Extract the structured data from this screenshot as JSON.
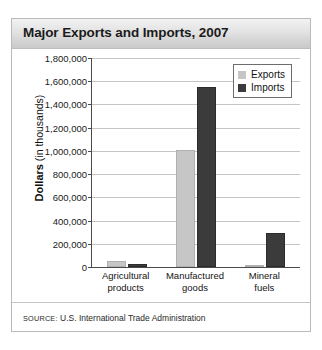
{
  "figure": {
    "title": "Major Exports and Imports, 2007",
    "source_label": "SOURCE:",
    "source_text": " U.S. International Trade Administration",
    "colors": {
      "exports": "#c6c6c6",
      "imports": "#3b3b3b",
      "title_band": "#e2e2e2",
      "gridline": "#c4c4c4",
      "axis": "#4a4a4a",
      "panel_border": "#b9b9b9"
    }
  },
  "chart_data": {
    "type": "bar",
    "title": "Major Exports and Imports, 2007",
    "subtitle": "",
    "xlabel": "",
    "ylabel": "Dollars (in thousands)",
    "ylabel_bold_part": "Dollars",
    "ylabel_plain_part": " (in thousands)",
    "categories": [
      "Agricultural products",
      "Manufactured goods",
      "Mineral fuels"
    ],
    "category_lines": [
      [
        "Agricultural",
        "products"
      ],
      [
        "Manufactured",
        "goods"
      ],
      [
        "Mineral",
        "fuels"
      ]
    ],
    "series": [
      {
        "name": "Exports",
        "color": "#c6c6c6",
        "values": [
          55000,
          1010000,
          20000
        ]
      },
      {
        "name": "Imports",
        "color": "#3b3b3b",
        "values": [
          25000,
          1550000,
          290000
        ]
      }
    ],
    "ylim": [
      0,
      1800000
    ],
    "ytick_step": 200000,
    "yticks": [
      0,
      200000,
      400000,
      600000,
      800000,
      1000000,
      1200000,
      1400000,
      1600000,
      1800000
    ],
    "ytick_labels": [
      "0",
      "200,000",
      "400,000",
      "600,000",
      "800,000",
      "1,000,000",
      "1,200,000",
      "1,400,000",
      "1,600,000",
      "1,800,000"
    ],
    "grid": true,
    "legend_position": "upper right",
    "legend_entries": [
      "Exports",
      "Imports"
    ]
  }
}
